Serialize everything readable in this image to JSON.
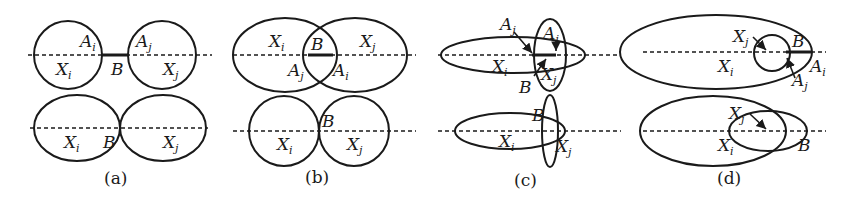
{
  "figure": {
    "panels": [
      {
        "caption": "(a)",
        "top": {
          "labels": {
            "Ai": "A",
            "Aj": "A",
            "B": "B",
            "Xi": "X",
            "Xj": "X"
          }
        },
        "bottom": {
          "labels": {
            "Xi": "X",
            "B": "B",
            "Xj": "X"
          }
        }
      },
      {
        "caption": "(b)",
        "top": {
          "labels": {
            "Xi": "X",
            "B": "B",
            "Xj": "X",
            "Aj": "A",
            "Ai": "A"
          }
        },
        "bottom": {
          "labels": {
            "B": "B",
            "Xi": "X",
            "Xj": "X"
          }
        }
      },
      {
        "caption": "(c)",
        "top": {
          "labels": {
            "Aj_outer": "A",
            "Aj_inner": "A",
            "Xi": "X",
            "Xj": "X",
            "B": "B"
          }
        },
        "bottom": {
          "labels": {
            "B": "B",
            "Xi": "X",
            "Xj": "X"
          }
        }
      },
      {
        "caption": "(d)",
        "top": {
          "labels": {
            "Xj": "X",
            "B": "B",
            "Xi": "X",
            "Ai": "A",
            "Aj": "A"
          }
        },
        "bottom": {
          "labels": {
            "Xj": "X",
            "Xi": "X",
            "B": "B"
          }
        }
      }
    ],
    "subscripts": {
      "i": "i",
      "j": "j"
    }
  }
}
